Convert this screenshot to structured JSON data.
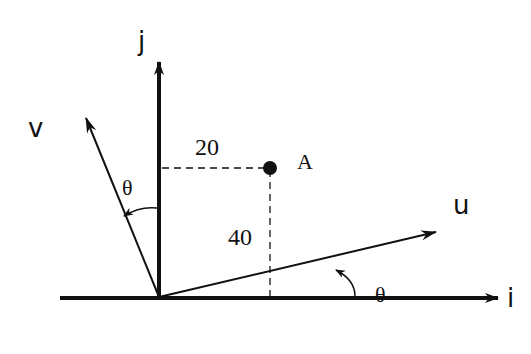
{
  "diagram": {
    "axes": {
      "i_label": "i",
      "j_label": "j"
    },
    "vectors": {
      "u_label": "u",
      "v_label": "v"
    },
    "point": {
      "label": "A",
      "horizontal_distance": "20",
      "vertical_distance": "40"
    },
    "angles": {
      "angle_v_label": "θ",
      "angle_u_label": "θ"
    },
    "colors": {
      "stroke": "#111111",
      "background": "#ffffff"
    }
  }
}
